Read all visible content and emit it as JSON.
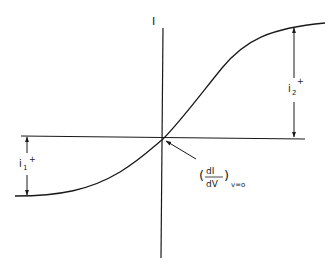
{
  "diagram": {
    "axis_y_label": "I",
    "labels": {
      "i2": {
        "base": "i",
        "sub": "2",
        "sup": "+"
      },
      "i1": {
        "base": "i",
        "sub": "1",
        "sup": "+"
      },
      "slope": {
        "numerator": "dI",
        "denominator": "dV",
        "open": "(",
        "close": ")",
        "subscript": "v=o"
      }
    },
    "colors": {
      "ink": "#1a1a1a",
      "background": "#ffffff"
    }
  }
}
